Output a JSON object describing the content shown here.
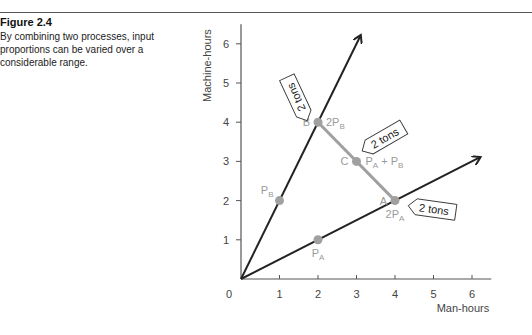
{
  "figure": {
    "title": "Figure 2.4",
    "caption": "By combining two processes, input proportions can be varied over a considerable range."
  },
  "chart_data": {
    "type": "line",
    "title": "",
    "xlabel": "Man-hours",
    "ylabel": "Machine-hours",
    "xlim": [
      0,
      6.5
    ],
    "ylim": [
      0,
      6.5
    ],
    "origin_label": "0",
    "x_ticks": [
      1,
      2,
      3,
      4,
      5,
      6
    ],
    "y_ticks": [
      1,
      2,
      3,
      4,
      5,
      6
    ],
    "x_tick_labels": [
      "1",
      "2",
      "3",
      "4",
      "5",
      "6"
    ],
    "y_tick_labels": [
      "1",
      "2",
      "3",
      "4",
      "5",
      "6"
    ],
    "rays": [
      {
        "name": "Process B",
        "from": [
          0,
          0
        ],
        "to": [
          3.1,
          6.2
        ]
      },
      {
        "name": "Process A",
        "from": [
          0,
          0
        ],
        "to": [
          6.2,
          3.1
        ]
      }
    ],
    "isoquant": {
      "name": "2 tons isoquant",
      "from": [
        2,
        4
      ],
      "to": [
        4,
        2
      ]
    },
    "points": [
      {
        "id": "PB",
        "x": 1,
        "y": 2,
        "label": "P",
        "sub": "B",
        "label_pos": "left"
      },
      {
        "id": "PA",
        "x": 2,
        "y": 1,
        "label": "P",
        "sub": "A",
        "label_pos": "below"
      },
      {
        "id": "B",
        "x": 2,
        "y": 4,
        "letter": "B",
        "label": "2P",
        "sub": "B",
        "label_pos": "right"
      },
      {
        "id": "C",
        "x": 3,
        "y": 3,
        "letter": "C",
        "label": "PA + PB",
        "label_pos": "right"
      },
      {
        "id": "A",
        "x": 4,
        "y": 2,
        "letter": "A",
        "label": "2P",
        "sub": "A",
        "label_pos": "below"
      }
    ],
    "annotations": [
      {
        "text": "2 tons",
        "target": "B"
      },
      {
        "text": "2 tons",
        "target": "C"
      },
      {
        "text": "2 tons",
        "target": "A"
      }
    ],
    "colors": {
      "rays": "#222222",
      "isoquant": "#a0a0a0",
      "points": "#a0a0a0",
      "axis": "#555555"
    }
  }
}
